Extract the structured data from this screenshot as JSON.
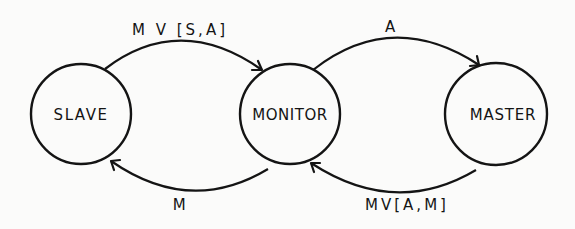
{
  "diagram": {
    "type": "state-transition",
    "nodes": [
      {
        "id": "slave",
        "label": "SLAVE",
        "cx": 81,
        "cy": 114,
        "r": 50
      },
      {
        "id": "monitor",
        "label": "MONITOR",
        "cx": 290,
        "cy": 114,
        "r": 50
      },
      {
        "id": "master",
        "label": "MASTER",
        "cx": 496,
        "cy": 114,
        "r": 51
      }
    ],
    "edges": [
      {
        "id": "slave-to-monitor",
        "from": "SLAVE",
        "to": "MONITOR",
        "label": "M V [S,A]"
      },
      {
        "id": "monitor-to-master",
        "from": "MONITOR",
        "to": "MASTER",
        "label": "A"
      },
      {
        "id": "monitor-to-slave",
        "from": "MONITOR",
        "to": "SLAVE",
        "label": "M"
      },
      {
        "id": "master-to-monitor",
        "from": "MASTER",
        "to": "MONITOR",
        "label": "MV[A,M]"
      }
    ],
    "colors": {
      "ink": "#141414",
      "background": "#fbfbfa"
    }
  }
}
